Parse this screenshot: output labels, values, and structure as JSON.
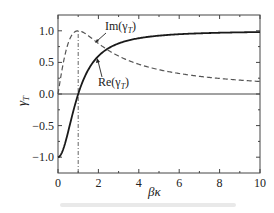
{
  "chart_data": {
    "type": "line",
    "title": "",
    "xlabel": "βκ",
    "ylabel": "γ_T",
    "xlim": [
      0,
      10
    ],
    "ylim": [
      -1.25,
      1.25
    ],
    "xticks": [
      0,
      2,
      4,
      6,
      8,
      10
    ],
    "xtick_labels": [
      "0",
      "2",
      "4",
      "6",
      "8",
      "10"
    ],
    "yticks": [
      -1.0,
      -0.5,
      0.0,
      0.5,
      1.0
    ],
    "ytick_labels": [
      "-1.0",
      "-0.5",
      "0.0",
      "0.5",
      "1.0"
    ],
    "grid": false,
    "legend": "none (inline annotations)",
    "series": [
      {
        "name": "Re(γ_T)",
        "style": "solid",
        "color": "#1a1a1a",
        "x": [
          0,
          0.25,
          0.5,
          0.75,
          1,
          1.5,
          2,
          3,
          4,
          5,
          6,
          7,
          8,
          9,
          10
        ],
        "y": [
          -1.0,
          -0.88,
          -0.6,
          -0.28,
          0.0,
          0.38,
          0.6,
          0.8,
          0.88,
          0.92,
          0.95,
          0.96,
          0.97,
          0.975,
          0.98
        ]
      },
      {
        "name": "Im(γ_T)",
        "style": "dashed",
        "color": "#555555",
        "x": [
          0,
          0.25,
          0.5,
          0.75,
          1,
          1.5,
          2,
          3,
          4,
          5,
          6,
          7,
          8,
          9,
          10
        ],
        "y": [
          0.0,
          0.47,
          0.8,
          0.96,
          1.0,
          0.92,
          0.8,
          0.6,
          0.47,
          0.38,
          0.32,
          0.28,
          0.25,
          0.22,
          0.2
        ]
      }
    ],
    "reference_lines": [
      {
        "type": "horizontal",
        "y": 0.0,
        "style": "solid"
      },
      {
        "type": "vertical",
        "x": 1.0,
        "style": "dash-dot",
        "from_y": -1.25,
        "to_y": 1.0
      }
    ],
    "annotations": [
      {
        "text": "Im(γ_T)",
        "arrow_to": [
          2.2,
          0.77
        ]
      },
      {
        "text": "Re(γ_T)",
        "arrow_to": [
          2.0,
          0.58
        ]
      }
    ]
  },
  "labels": {
    "ylabel": "γ",
    "ylabel_sub": "T",
    "xlabel": "βκ",
    "im_label": "Im(γ",
    "im_sub": "T",
    "re_label": "Re(γ",
    "re_sub": "T",
    "close_paren": ")"
  }
}
